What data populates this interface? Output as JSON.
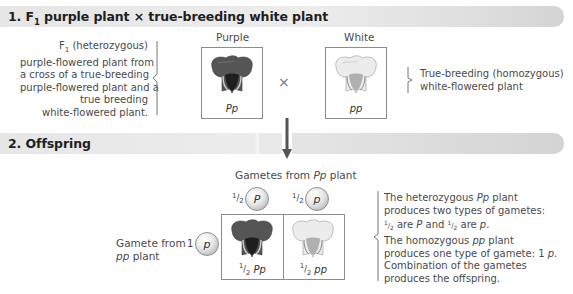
{
  "section1": {
    "number": "1.",
    "title_prefix": "F",
    "title_sub": "1",
    "title_rest": " purple plant × true-breeding white plant",
    "left_note": {
      "line1_prefix": "F",
      "line1_sub": "1",
      "line1_rest": " (heterozygous)",
      "line2": "purple-flowered plant from",
      "line3": "a cross of a true-breeding",
      "line4": "purple-flowered plant and a",
      "line5": "true breeding",
      "line6": "white-flowered plant."
    },
    "purple_label": "Purple",
    "purple_genotype": "Pp",
    "cross_symbol": "×",
    "white_label": "White",
    "white_genotype": "pp",
    "right_note": {
      "line1": "True-breeding (homozygous)",
      "line2": "white-flowered plant"
    }
  },
  "section2": {
    "number": "2.",
    "title": "Offspring",
    "gametes_header_prefix": "Gametes from ",
    "gametes_header_geno": "Pp",
    "gametes_header_suffix": " plant",
    "top_gametes": [
      {
        "fraction_num": "1",
        "fraction_den": "2",
        "allele": "P"
      },
      {
        "fraction_num": "1",
        "fraction_den": "2",
        "allele": "p"
      }
    ],
    "left_gamete_label_line1": "Gamete from",
    "left_gamete_label_geno": "pp",
    "left_gamete_label_suffix": " plant",
    "left_gamete": {
      "fraction": "1",
      "allele": "p"
    },
    "offspring": [
      {
        "fraction_num": "1",
        "fraction_den": "2",
        "genotype": "Pp",
        "phenotype": "purple"
      },
      {
        "fraction_num": "1",
        "fraction_den": "2",
        "genotype": "pp",
        "phenotype": "white"
      }
    ],
    "right_note": {
      "line1_prefix": "The heterozygous ",
      "line1_geno": "Pp",
      "line1_suffix": " plant",
      "line2": "produces two types of gametes:",
      "line3_frac_num": "1",
      "line3_frac_den": "2",
      "line3_a": " are ",
      "line3_P": "P",
      "line3_b": " and ",
      "line3_frac2_num": "1",
      "line3_frac2_den": "2",
      "line3_c": " are ",
      "line3_p": "p",
      "line3_end": ".",
      "line4_prefix": "The homozygous ",
      "line4_geno": "pp",
      "line4_suffix": " plant",
      "line5_prefix": "produces one type of gamete: 1 ",
      "line5_allele": "p",
      "line5_end": ".",
      "line6": "Combination of the gametes",
      "line7": "produces the offspring."
    }
  },
  "colors": {
    "purple_flower": "#4a4a4a",
    "white_flower": "#e6e6e6",
    "band": "#e4e4e4",
    "arrow": "#555555"
  }
}
